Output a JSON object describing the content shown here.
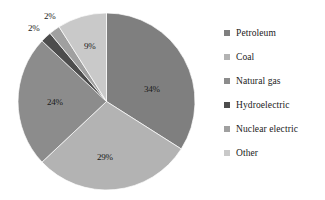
{
  "chart_data": {
    "type": "pie",
    "title": "",
    "labels": [
      "Petroleum",
      "Coal",
      "Natural gas",
      "Hydroelectric",
      "Nuclear electric",
      "Other"
    ],
    "values": [
      34,
      29,
      24,
      2,
      2,
      9
    ],
    "value_labels": [
      "34%",
      "29%",
      "24%",
      "2%",
      "2%",
      "9%"
    ],
    "colors": [
      "#7f7f7f",
      "#b3b3b3",
      "#8c8c8c",
      "#4d4d4d",
      "#a0a0a0",
      "#c9c9c9"
    ],
    "start_angle_deg": 0,
    "direction": "clockwise",
    "legend_position": "right",
    "grid": false,
    "units": "percent"
  },
  "legend": {
    "items": [
      {
        "label": "Petroleum",
        "color": "#7f7f7f"
      },
      {
        "label": "Coal",
        "color": "#b3b3b3"
      },
      {
        "label": "Natural gas",
        "color": "#8c8c8c"
      },
      {
        "label": "Hydroelectric",
        "color": "#4d4d4d"
      },
      {
        "label": "Nuclear electric",
        "color": "#a0a0a0"
      },
      {
        "label": "Other",
        "color": "#c9c9c9"
      }
    ]
  },
  "slice_labels": [
    {
      "text": "34%",
      "left": 144,
      "top": 84
    },
    {
      "text": "29%",
      "left": 97,
      "top": 152
    },
    {
      "text": "24%",
      "left": 47,
      "top": 97
    },
    {
      "text": "2%",
      "left": 44,
      "top": 11
    },
    {
      "text": "2%",
      "left": 28,
      "top": 23
    },
    {
      "text": "9%",
      "left": 84,
      "top": 41
    }
  ]
}
